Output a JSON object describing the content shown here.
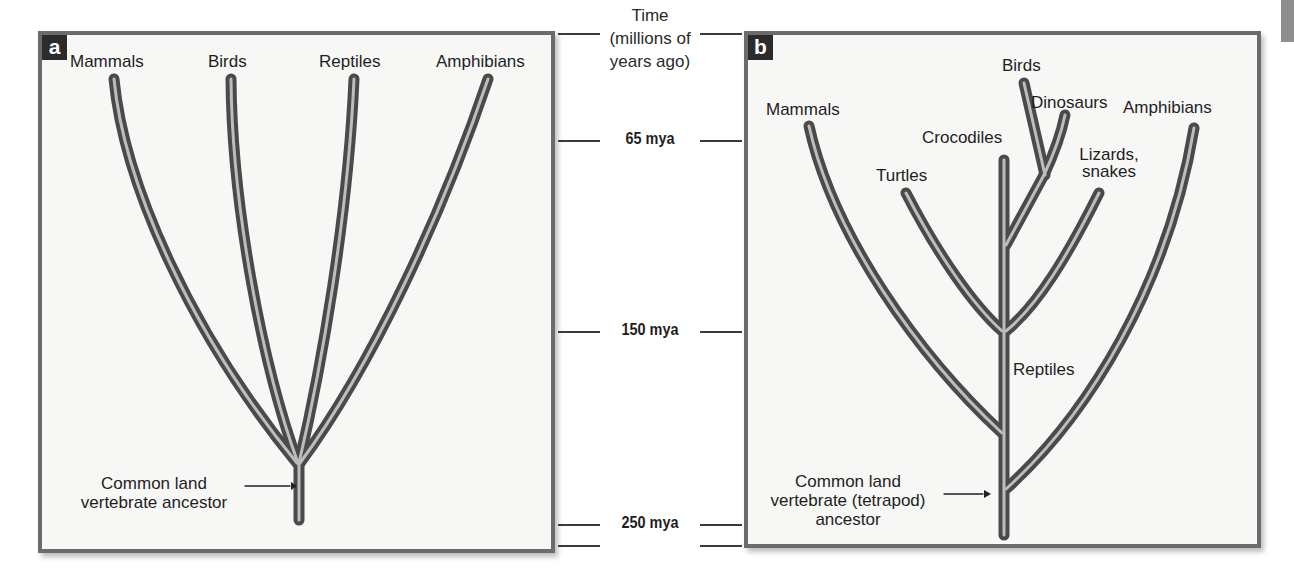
{
  "figure": {
    "panel_a": {
      "badge": "a",
      "taxa": [
        {
          "label": "Mammals"
        },
        {
          "label": "Birds"
        },
        {
          "label": "Reptiles"
        },
        {
          "label": "Amphibians"
        }
      ],
      "ancestor_label_line1": "Common land",
      "ancestor_label_line2": "vertebrate ancestor"
    },
    "panel_b": {
      "badge": "b",
      "taxa": {
        "mammals": "Mammals",
        "turtles": "Turtles",
        "crocodiles": "Crocodiles",
        "birds": "Birds",
        "dinosaurs": "Dinosaurs",
        "lizards_line1": "Lizards,",
        "lizards_line2": "snakes",
        "amphibians": "Amphibians",
        "reptiles": "Reptiles"
      },
      "ancestor_label_line1": "Common land",
      "ancestor_label_line2": "vertebrate (tetrapod)",
      "ancestor_label_line3": "ancestor"
    },
    "time_axis": {
      "title_line1": "Time",
      "title_line2": "(millions of",
      "title_line3": "years ago)",
      "ticks": [
        {
          "label": "65 mya"
        },
        {
          "label": "150 mya"
        },
        {
          "label": "250 mya"
        }
      ]
    },
    "colors": {
      "branch": "#4a4a4a",
      "branch_highlight": "#b8b8b8",
      "panel_border": "#6b6b6b",
      "panel_bg": "#f7f7f6",
      "badge_bg": "#2b2b2b"
    }
  }
}
